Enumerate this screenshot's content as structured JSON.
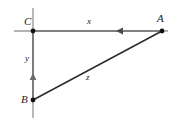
{
  "figure": {
    "type": "geometry-diagram",
    "canvas": {
      "width": 179,
      "height": 125,
      "background": "#ffffff"
    },
    "colors": {
      "axis": "#8c8c8c",
      "segment": "#3a3a3a",
      "hypotenuse": "#2b2b2b",
      "point": "#111111",
      "label": "#1a1a1a"
    },
    "vertices": [
      {
        "id": "C",
        "label": "C",
        "x": 33,
        "y": 31
      },
      {
        "id": "A",
        "label": "A",
        "x": 162,
        "y": 31
      },
      {
        "id": "B",
        "label": "B",
        "x": 33,
        "y": 100
      }
    ],
    "segments": [
      {
        "id": "x",
        "label": "x",
        "from": "C",
        "to": "A",
        "orientation": "horizontal",
        "arrow": "toward-C",
        "arrow_at": {
          "x": 120,
          "y": 31
        }
      },
      {
        "id": "y",
        "label": "y",
        "from": "B",
        "to": "C",
        "orientation": "vertical",
        "arrow": "toward-C",
        "arrow_at": {
          "x": 33,
          "y": 78
        }
      },
      {
        "id": "z",
        "label": "z",
        "from": "B",
        "to": "A",
        "orientation": "diagonal",
        "arrow": "none"
      }
    ],
    "axes": {
      "vertical": {
        "x": 33,
        "y_start": 8,
        "y_end": 118
      },
      "horizontal": {
        "y": 31,
        "x_start": 14,
        "x_end": 168
      }
    }
  }
}
